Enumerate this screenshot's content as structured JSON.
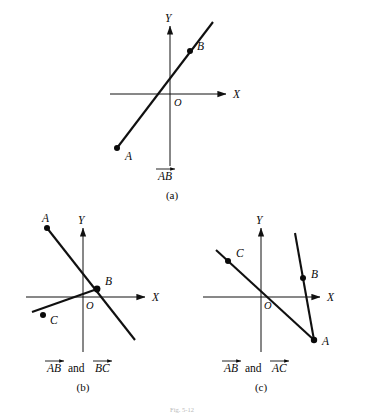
{
  "figure": {
    "caption": "Fig. 5-12",
    "background_color": "#ffffff",
    "ink_color": "#0a0a0a",
    "panels": [
      {
        "id": "a",
        "label": "(a)",
        "vector_text": "AB",
        "vector_parts": [
          "AB"
        ],
        "connector": "",
        "axis_x_label": "X",
        "axis_y_label": "Y",
        "origin_label": "O",
        "points": [
          {
            "name": "A",
            "label": "A",
            "x": -2.3,
            "y": -1.6
          },
          {
            "name": "B",
            "label": "B",
            "x": 1.1,
            "y": 1.25
          }
        ]
      },
      {
        "id": "b",
        "label": "(b)",
        "vector_text": "AB and BC",
        "vector_parts": [
          "AB",
          "BC"
        ],
        "connector": "and",
        "axis_x_label": "X",
        "axis_y_label": "Y",
        "origin_label": "O",
        "points": [
          {
            "name": "A",
            "label": "A",
            "x": -1.85,
            "y": 1.95
          },
          {
            "name": "B",
            "label": "B",
            "x": 0.35,
            "y": 0.45
          },
          {
            "name": "C",
            "label": "C",
            "x": -1.55,
            "y": -0.55
          }
        ]
      },
      {
        "id": "c",
        "label": "(c)",
        "vector_text": "AB and AC",
        "vector_parts": [
          "AB",
          "AC"
        ],
        "connector": "and",
        "axis_x_label": "X",
        "axis_y_label": "Y",
        "origin_label": "O",
        "points": [
          {
            "name": "A",
            "label": "A",
            "x": 1.55,
            "y": -1.95
          },
          {
            "name": "B",
            "label": "B",
            "x": 1.15,
            "y": 0.7
          },
          {
            "name": "C",
            "label": "C",
            "x": -1.45,
            "y": 1.2
          }
        ]
      }
    ]
  }
}
